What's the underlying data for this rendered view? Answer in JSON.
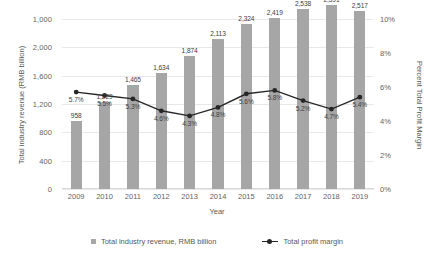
{
  "chart_data": {
    "type": "bar",
    "title": "",
    "subtitle": "",
    "xlabel": "Year",
    "ylabel": "Total industry revenue (RMB billion)",
    "y2label": "Percent Total Profit Margin",
    "categories": [
      "2009",
      "2010",
      "2011",
      "2012",
      "2013",
      "2014",
      "2015",
      "2016",
      "2017",
      "2018",
      "2019"
    ],
    "grid": true,
    "legend_position": "bottom",
    "ylim": [
      0,
      2400
    ],
    "yticks": [
      "0",
      "400",
      "800",
      "1,200",
      "1,600",
      "2,000",
      "1,000"
    ],
    "ytick_values": [
      0,
      400,
      800,
      1200,
      1600,
      2000,
      2400
    ],
    "y2lim": [
      0,
      10
    ],
    "y2ticks": [
      "0%",
      "2%",
      "4%",
      "6%",
      "8%",
      "10%"
    ],
    "y2tick_values": [
      0,
      2,
      4,
      6,
      8,
      10
    ],
    "series": [
      {
        "name": "Total industry revenue, RMB billion",
        "type": "bar",
        "axis": "left",
        "color": "#a6a6a6",
        "values": [
          958,
          1229,
          1465,
          1634,
          1874,
          2113,
          2324,
          2419,
          2538,
          2591,
          2517
        ],
        "labels": [
          "958",
          "1,229",
          "1,465",
          "1,634",
          "1,874",
          "2,113",
          "2,324",
          "2,419",
          "2,538",
          "2,591",
          "2,517"
        ]
      },
      {
        "name": "Total profit margin",
        "type": "line",
        "axis": "right",
        "color": "#262626",
        "values": [
          5.7,
          5.5,
          5.3,
          4.6,
          4.3,
          4.8,
          5.6,
          5.8,
          5.2,
          4.7,
          5.4
        ],
        "labels": [
          "5.7%",
          "5.5%",
          "5.3%",
          "4.6%",
          "4.3%",
          "4.8%",
          "5.6%",
          "5.8%",
          "5.2%",
          "4.7%",
          "5.4%"
        ]
      }
    ]
  },
  "legend": {
    "items": [
      {
        "label": "Total industry revenue, RMB billion",
        "marker": "square-swatch"
      },
      {
        "label": "Total profit margin",
        "marker": "line-marker-swatch"
      }
    ]
  }
}
